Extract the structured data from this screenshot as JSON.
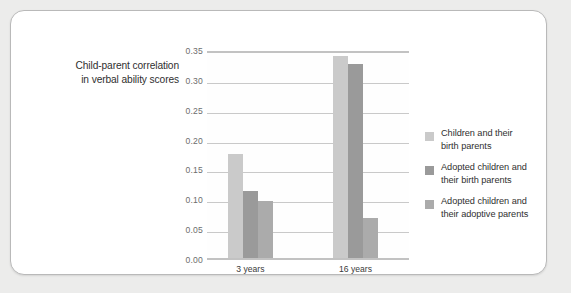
{
  "side_title": {
    "line1": "Child-parent correlation",
    "line2": "in verbal ability scores"
  },
  "legend": {
    "items": [
      {
        "label_line1": "Children and their",
        "label_line2": "birth parents",
        "color": "#cacaca"
      },
      {
        "label_line1": "Adopted children and",
        "label_line2": "their birth parents",
        "color": "#9a9a9a"
      },
      {
        "label_line1": "Adopted children and",
        "label_line2": "their adoptive parents",
        "color": "#ababab"
      }
    ]
  },
  "axis": {
    "y_ticks": [
      "0.00",
      "0.05",
      "0.10",
      "0.15",
      "0.20",
      "0.25",
      "0.30",
      "0.35"
    ],
    "x_ticks": [
      "3 years",
      "16 years"
    ]
  },
  "chart_data": {
    "type": "bar",
    "title": "Child-parent correlation in verbal ability scores",
    "xlabel": "",
    "ylabel": "Child-parent correlation in verbal ability scores",
    "categories": [
      "3 years",
      "16 years"
    ],
    "series": [
      {
        "name": "Children and their birth parents",
        "values": [
          0.175,
          0.338
        ],
        "color": "#cacaca"
      },
      {
        "name": "Adopted children and their birth parents",
        "values": [
          0.112,
          0.325
        ],
        "color": "#9a9a9a"
      },
      {
        "name": "Adopted children and their adoptive parents",
        "values": [
          0.096,
          0.067
        ],
        "color": "#ababab"
      }
    ],
    "ylim": [
      0.0,
      0.35
    ],
    "ytick_step": 0.05,
    "grid": true,
    "legend_position": "right"
  },
  "colors": {
    "background": "#ececeb",
    "card": "#ffffff",
    "gridline": "#c9c9c9",
    "axis": "#c2c2c2",
    "text": "#2f2f2f",
    "tick_text": "#6d6d6d"
  }
}
